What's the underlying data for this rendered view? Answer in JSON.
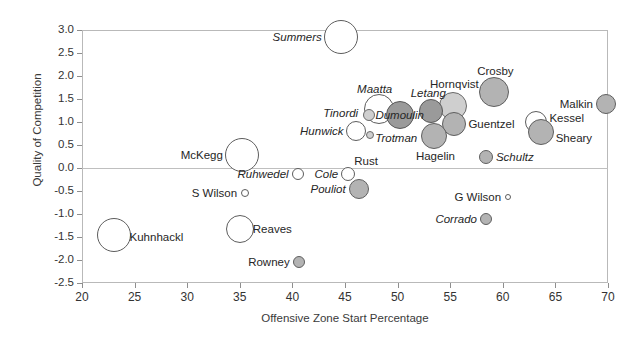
{
  "chart_data": {
    "type": "scatter",
    "title": "",
    "xlabel": "Offensive Zone Start Percentage",
    "ylabel": "Quality of Competition",
    "xlim": [
      20,
      70
    ],
    "ylim": [
      -2.5,
      3.0
    ],
    "xticks": [
      20,
      25,
      30,
      35,
      40,
      45,
      50,
      55,
      60,
      65,
      70
    ],
    "yticks": [
      "3.0",
      "2.5",
      "2.0",
      "1.5",
      "1.0",
      "0.5",
      "0.0",
      "-0.5",
      "-1.0",
      "-1.5",
      "-2.0",
      "-2.5"
    ],
    "grid": false,
    "legend": "none",
    "size_note": "bubble area encodes a third variable (ice time)",
    "points": [
      {
        "label": "Summers",
        "x": 44.6,
        "y": 2.85,
        "r": 17,
        "fill": "open",
        "label_pos": "left",
        "italic": true,
        "label_dx": -19,
        "label_dy": 0
      },
      {
        "label": "Crosby",
        "x": 59.2,
        "y": 1.65,
        "r": 15,
        "fill": "filled",
        "label_pos": "above",
        "italic": false,
        "label_dx": 1,
        "label_dy": -21
      },
      {
        "label": "Hornqvist",
        "x": 55.3,
        "y": 1.35,
        "r": 14,
        "fill": "filled-light",
        "label_pos": "above",
        "italic": false,
        "label_dx": 1,
        "label_dy": -22
      },
      {
        "label": "Letang",
        "x": 53.2,
        "y": 1.25,
        "r": 12,
        "fill": "filled-dark",
        "label_pos": "above",
        "italic": true,
        "label_dx": -3,
        "label_dy": -18
      },
      {
        "label": "Malkin",
        "x": 69.8,
        "y": 1.4,
        "r": 10,
        "fill": "filled",
        "label_pos": "left",
        "italic": false,
        "label_dx": -13,
        "label_dy": 0
      },
      {
        "label": "Maatta",
        "x": 48.2,
        "y": 1.28,
        "r": 15,
        "fill": "open",
        "label_pos": "above",
        "italic": true,
        "label_dx": -4,
        "label_dy": -20
      },
      {
        "label": "Tinordi",
        "x": 47.3,
        "y": 1.15,
        "r": 6,
        "fill": "filled-light",
        "label_pos": "left",
        "italic": true,
        "label_dx": -11,
        "label_dy": -2
      },
      {
        "label": "Dumoulin",
        "x": 50.2,
        "y": 1.15,
        "r": 14,
        "fill": "filled-dark",
        "label_pos": "center",
        "italic": true,
        "label_dx": 0,
        "label_dy": 0
      },
      {
        "label": "Guentzel",
        "x": 55.4,
        "y": 0.95,
        "r": 12,
        "fill": "filled",
        "label_pos": "right",
        "italic": false,
        "label_dx": 14,
        "label_dy": 0
      },
      {
        "label": "Kessel",
        "x": 63.2,
        "y": 1.0,
        "r": 11,
        "fill": "open",
        "label_pos": "right",
        "italic": false,
        "label_dx": 13,
        "label_dy": -4
      },
      {
        "label": "Sheary",
        "x": 63.6,
        "y": 0.78,
        "r": 13,
        "fill": "filled",
        "label_pos": "right",
        "italic": false,
        "label_dx": 15,
        "label_dy": 6
      },
      {
        "label": "Hunwick",
        "x": 46.0,
        "y": 0.8,
        "r": 10,
        "fill": "open",
        "label_pos": "left",
        "italic": true,
        "label_dx": -12,
        "label_dy": 0
      },
      {
        "label": "Trotman",
        "x": 47.4,
        "y": 0.72,
        "r": 4,
        "fill": "filled-light",
        "label_pos": "right",
        "italic": true,
        "label_dx": 5,
        "label_dy": 3
      },
      {
        "label": "Rust",
        "x": 47.0,
        "y": 0.45,
        "r": 0,
        "fill": "none",
        "label_pos": "below",
        "italic": false,
        "label_dx": 0,
        "label_dy": 14
      },
      {
        "label": "Hagelin",
        "x": 53.5,
        "y": 0.7,
        "r": 13,
        "fill": "filled",
        "label_pos": "below",
        "italic": false,
        "label_dx": 1,
        "label_dy": 20
      },
      {
        "label": "Schultz",
        "x": 58.4,
        "y": 0.25,
        "r": 7,
        "fill": "filled",
        "label_pos": "right",
        "italic": true,
        "label_dx": 10,
        "label_dy": 0
      },
      {
        "label": "McKegg",
        "x": 35.2,
        "y": 0.28,
        "r": 17,
        "fill": "open",
        "label_pos": "left",
        "italic": false,
        "label_dx": -19,
        "label_dy": 0
      },
      {
        "label": "Ruhwedel",
        "x": 40.5,
        "y": -0.12,
        "r": 6,
        "fill": "open",
        "label_pos": "left",
        "italic": true,
        "label_dx": -9,
        "label_dy": 0
      },
      {
        "label": "Cole",
        "x": 45.3,
        "y": -0.12,
        "r": 7,
        "fill": "open",
        "label_pos": "left",
        "italic": true,
        "label_dx": -10,
        "label_dy": 0
      },
      {
        "label": "Pouliot",
        "x": 46.3,
        "y": -0.45,
        "r": 10,
        "fill": "filled",
        "label_pos": "left",
        "italic": true,
        "label_dx": -13,
        "label_dy": 0
      },
      {
        "label": "S Wilson",
        "x": 35.5,
        "y": -0.55,
        "r": 4,
        "fill": "open",
        "label_pos": "left",
        "italic": false,
        "label_dx": -8,
        "label_dy": 0
      },
      {
        "label": "G Wilson",
        "x": 60.5,
        "y": -0.62,
        "r": 3,
        "fill": "open",
        "label_pos": "left",
        "italic": false,
        "label_dx": -7,
        "label_dy": 0
      },
      {
        "label": "Corrado",
        "x": 58.4,
        "y": -1.1,
        "r": 6,
        "fill": "filled",
        "label_pos": "left",
        "italic": true,
        "label_dx": -9,
        "label_dy": 0
      },
      {
        "label": "Reaves",
        "x": 35.0,
        "y": -1.32,
        "r": 14,
        "fill": "open",
        "label_pos": "right",
        "italic": false,
        "label_dx": 13,
        "label_dy": 0
      },
      {
        "label": "Kuhnhackl",
        "x": 23.0,
        "y": -1.45,
        "r": 17,
        "fill": "open",
        "label_pos": "right",
        "italic": false,
        "label_dx": 16,
        "label_dy": 2
      },
      {
        "label": "Rowney",
        "x": 40.6,
        "y": -2.05,
        "r": 6,
        "fill": "filled",
        "label_pos": "left",
        "italic": false,
        "label_dx": -9,
        "label_dy": 0
      }
    ]
  }
}
